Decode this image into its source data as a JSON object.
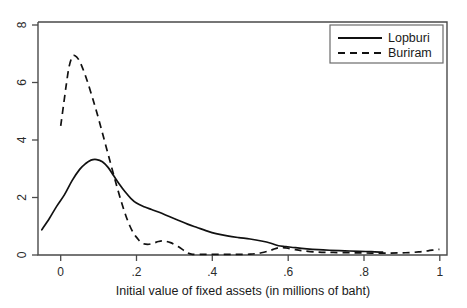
{
  "chart_data": {
    "type": "line",
    "title": "",
    "subtitle": "",
    "xlabel": "Initial value of fixed assets (in millions of baht)",
    "ylabel": "",
    "xlim": [
      -0.06,
      1.02
    ],
    "ylim": [
      0,
      8.3
    ],
    "xticks": [
      "0",
      ".2",
      ".4",
      ".6",
      ".8",
      "1"
    ],
    "xtick_values": [
      0,
      0.2,
      0.4,
      0.6,
      0.8,
      1
    ],
    "yticks": [
      "0",
      "2",
      "4",
      "6",
      "8"
    ],
    "ytick_values": [
      0,
      2,
      4,
      6,
      8
    ],
    "grid": false,
    "legend_position": "top-right",
    "series": [
      {
        "name": "Lopburi",
        "style": "solid",
        "color": "#111111",
        "x": [
          -0.05,
          -0.03,
          -0.01,
          0.01,
          0.03,
          0.05,
          0.065,
          0.08,
          0.095,
          0.11,
          0.125,
          0.14,
          0.155,
          0.17,
          0.185,
          0.2,
          0.22,
          0.24,
          0.26,
          0.285,
          0.31,
          0.335,
          0.36,
          0.385,
          0.41,
          0.44,
          0.47,
          0.5,
          0.53,
          0.555,
          0.575,
          0.595,
          0.62,
          0.65,
          0.68,
          0.71,
          0.75,
          0.79,
          0.82,
          0.85
        ],
        "y": [
          0.9,
          1.3,
          1.75,
          2.15,
          2.65,
          3.05,
          3.25,
          3.38,
          3.4,
          3.32,
          3.12,
          2.82,
          2.52,
          2.25,
          2.02,
          1.85,
          1.72,
          1.62,
          1.52,
          1.38,
          1.24,
          1.1,
          0.98,
          0.86,
          0.76,
          0.68,
          0.62,
          0.57,
          0.5,
          0.42,
          0.33,
          0.3,
          0.26,
          0.22,
          0.19,
          0.17,
          0.15,
          0.13,
          0.12,
          0.1
        ]
      },
      {
        "name": "Buriram",
        "style": "dashed",
        "color": "#111111",
        "x": [
          0.0,
          0.008,
          0.015,
          0.022,
          0.03,
          0.038,
          0.048,
          0.058,
          0.07,
          0.085,
          0.1,
          0.115,
          0.13,
          0.145,
          0.16,
          0.172,
          0.182,
          0.192,
          0.202,
          0.215,
          0.23,
          0.245,
          0.258,
          0.272,
          0.29,
          0.31,
          0.33,
          0.345,
          0.38,
          0.42,
          0.46,
          0.5,
          0.53,
          0.555,
          0.575,
          0.595,
          0.615,
          0.64,
          0.68,
          0.72,
          0.77,
          0.82,
          0.87,
          0.91,
          0.945,
          0.97,
          0.99,
          1.0
        ],
        "y": [
          4.6,
          5.4,
          6.1,
          6.7,
          7.05,
          7.1,
          6.95,
          6.65,
          6.2,
          5.55,
          4.85,
          4.1,
          3.35,
          2.6,
          1.9,
          1.4,
          1.05,
          0.78,
          0.6,
          0.42,
          0.38,
          0.42,
          0.48,
          0.5,
          0.44,
          0.3,
          0.12,
          0.03,
          0.02,
          0.02,
          0.02,
          0.03,
          0.08,
          0.17,
          0.26,
          0.25,
          0.2,
          0.15,
          0.1,
          0.09,
          0.08,
          0.07,
          0.07,
          0.08,
          0.11,
          0.15,
          0.19,
          0.2
        ]
      }
    ]
  },
  "legend": {
    "items": [
      {
        "label": "Lopburi",
        "style": "solid"
      },
      {
        "label": "Buriram",
        "style": "dashed"
      }
    ]
  }
}
